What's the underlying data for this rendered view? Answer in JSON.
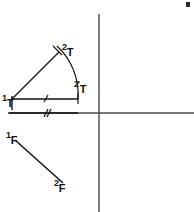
{
  "figure": {
    "background_color": "#ffffff",
    "ink_color": "#111111",
    "axis_color": "#4a4a4a",
    "width": 194,
    "height": 212
  },
  "axes": {
    "vertical": {
      "x": 99,
      "y_top": 14,
      "y_bottom": 212
    },
    "horizontal": {
      "y": 113,
      "x_left": 8,
      "x_right": 194
    }
  },
  "labels": {
    "point_1T": {
      "sup": "1",
      "base": "T"
    },
    "point_2T": {
      "sup": "2",
      "base": "T"
    },
    "point_2primeT": {
      "sup": "2",
      "prime": "′",
      "base": "T"
    },
    "point_1F": {
      "sup": "1",
      "base": "F"
    },
    "point_2F": {
      "sup": "2",
      "base": "F"
    }
  },
  "segments": {
    "upper_horizontal": {
      "x1": 12,
      "y1": 99,
      "x2": 78,
      "y2": 99,
      "ticks": 1
    },
    "lower_horizontal": {
      "x1": 9,
      "y1": 113,
      "x2": 78,
      "y2": 113,
      "ticks": 2
    },
    "ray_1T_2T": {
      "x1": 12,
      "y1": 99,
      "x2": 59,
      "y2": 52
    },
    "segment_1F_2F": {
      "x1": 15,
      "y1": 140,
      "x2": 63,
      "y2": 183
    }
  },
  "arc": {
    "center_x": 12,
    "center_y": 99,
    "radius": 66,
    "from_x": 57,
    "from_y": 46,
    "to_x": 78,
    "to_y": 99
  },
  "corner_mark": {
    "x": 186,
    "y": 2,
    "width": 4,
    "height": 5
  }
}
